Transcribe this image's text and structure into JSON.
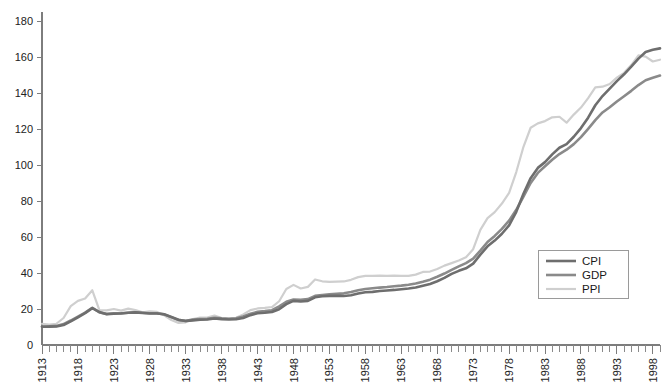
{
  "chart_data": {
    "type": "line",
    "title": "",
    "subtitle": "",
    "xlabel": "",
    "ylabel": "",
    "xlim": [
      1913,
      1999
    ],
    "ylim": [
      0,
      180
    ],
    "y_ticks": [
      0,
      20,
      40,
      60,
      80,
      100,
      120,
      140,
      160,
      180
    ],
    "x_ticks": [
      1913,
      1918,
      1923,
      1928,
      1933,
      1938,
      1943,
      1948,
      1953,
      1958,
      1963,
      1968,
      1973,
      1978,
      1983,
      1988,
      1993,
      1998
    ],
    "x_minor_tick_interval": 1,
    "grid": false,
    "legend_position": "bottom-right",
    "x": [
      1913,
      1914,
      1915,
      1916,
      1917,
      1918,
      1919,
      1920,
      1921,
      1922,
      1923,
      1924,
      1925,
      1926,
      1927,
      1928,
      1929,
      1930,
      1931,
      1932,
      1933,
      1934,
      1935,
      1936,
      1937,
      1938,
      1939,
      1940,
      1941,
      1942,
      1943,
      1944,
      1945,
      1946,
      1947,
      1948,
      1949,
      1950,
      1951,
      1952,
      1953,
      1954,
      1955,
      1956,
      1957,
      1958,
      1959,
      1960,
      1961,
      1962,
      1963,
      1964,
      1965,
      1966,
      1967,
      1968,
      1969,
      1970,
      1971,
      1972,
      1973,
      1974,
      1975,
      1976,
      1977,
      1978,
      1979,
      1980,
      1981,
      1982,
      1983,
      1984,
      1985,
      1986,
      1987,
      1988,
      1989,
      1990,
      1991,
      1992,
      1993,
      1994,
      1995,
      1996,
      1997,
      1998,
      1999
    ],
    "series": [
      {
        "name": "CPI",
        "color": "#6e6e6e",
        "width": 2.6,
        "values": [
          10.1,
          10.2,
          10.3,
          11.1,
          13.1,
          15.4,
          17.7,
          20.5,
          18.3,
          17.1,
          17.4,
          17.5,
          17.9,
          18.1,
          17.8,
          17.5,
          17.5,
          17.1,
          15.6,
          14.0,
          13.3,
          13.7,
          14.0,
          14.2,
          14.7,
          14.4,
          14.2,
          14.3,
          15.0,
          16.6,
          17.6,
          17.9,
          18.3,
          19.9,
          22.7,
          24.5,
          24.2,
          24.5,
          26.5,
          27.1,
          27.3,
          27.3,
          27.2,
          27.6,
          28.6,
          29.3,
          29.5,
          30.0,
          30.3,
          30.6,
          31.0,
          31.4,
          31.9,
          32.9,
          33.9,
          35.4,
          37.3,
          39.5,
          41.2,
          42.6,
          45.2,
          50.2,
          54.8,
          58.0,
          61.8,
          66.5,
          74.0,
          84.0,
          92.7,
          98.4,
          101.6,
          105.9,
          109.6,
          111.6,
          115.7,
          120.5,
          126.3,
          133.2,
          138.3,
          142.4,
          146.6,
          150.4,
          154.6,
          159.1,
          162.8,
          164.0,
          164.8
        ]
      },
      {
        "name": "GDP",
        "color": "#8a8a8a",
        "width": 2.6,
        "values": [
          10.3,
          10.4,
          10.6,
          11.6,
          13.6,
          15.8,
          18.0,
          20.7,
          18.1,
          17.3,
          17.6,
          17.6,
          17.9,
          18.2,
          17.9,
          17.6,
          17.6,
          17.0,
          15.5,
          13.8,
          13.4,
          14.1,
          14.4,
          14.5,
          15.1,
          14.8,
          14.6,
          14.8,
          15.8,
          17.4,
          18.4,
          18.8,
          19.3,
          21.5,
          24.0,
          25.3,
          25.1,
          25.5,
          27.3,
          27.8,
          28.1,
          28.4,
          28.7,
          29.5,
          30.4,
          31.1,
          31.5,
          31.9,
          32.2,
          32.6,
          33.0,
          33.5,
          34.2,
          35.2,
          36.3,
          37.9,
          39.7,
          41.7,
          43.7,
          45.5,
          48.0,
          52.4,
          57.2,
          60.6,
          64.5,
          69.1,
          75.1,
          82.4,
          90.0,
          95.6,
          99.3,
          102.9,
          106.1,
          108.5,
          111.6,
          115.5,
          120.1,
          124.9,
          129.2,
          132.1,
          135.3,
          138.2,
          141.2,
          144.4,
          147.1,
          148.5,
          149.7
        ]
      },
      {
        "name": "PPI",
        "color": "#cfcfcf",
        "width": 2.2,
        "values": [
          11.8,
          11.4,
          11.8,
          15.0,
          21.6,
          24.5,
          25.8,
          30.4,
          19.3,
          19.2,
          20.0,
          19.1,
          20.2,
          19.4,
          18.2,
          18.7,
          18.4,
          16.5,
          13.9,
          12.3,
          12.6,
          14.4,
          15.2,
          15.2,
          16.4,
          15.0,
          14.7,
          15.1,
          17.0,
          19.4,
          20.3,
          20.6,
          21.1,
          24.3,
          31.1,
          33.4,
          31.4,
          32.3,
          36.4,
          35.4,
          35.1,
          35.2,
          35.3,
          36.2,
          37.7,
          38.4,
          38.4,
          38.5,
          38.4,
          38.5,
          38.4,
          38.4,
          39.1,
          40.6,
          40.8,
          42.2,
          44.1,
          45.5,
          46.9,
          48.7,
          53.2,
          64.0,
          70.5,
          73.8,
          78.6,
          84.5,
          96.1,
          110.1,
          120.7,
          123.1,
          124.4,
          126.5,
          126.8,
          123.5,
          128.0,
          131.9,
          137.2,
          143.1,
          143.5,
          145.0,
          148.5,
          151.2,
          155.5,
          160.9,
          160.2,
          157.5,
          158.5
        ]
      }
    ],
    "legend_entries": [
      {
        "label": "CPI",
        "color": "#6e6e6e"
      },
      {
        "label": "GDP",
        "color": "#8a8a8a"
      },
      {
        "label": "PPI",
        "color": "#cfcfcf"
      }
    ]
  },
  "colors": {
    "background": "#ffffff",
    "axis": "#7d7d7d",
    "tick_text": "#222222",
    "legend_border": "#9a9a9a"
  }
}
